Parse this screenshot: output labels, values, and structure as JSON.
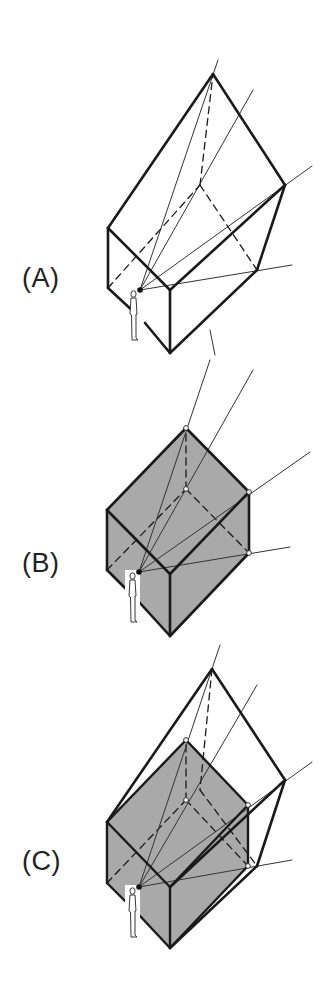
{
  "figure": {
    "panels": [
      {
        "id": "A",
        "label": "(A)",
        "label_pos": [
          22,
          265
        ],
        "shaded_box": false,
        "show_outer_volume": true
      },
      {
        "id": "B",
        "label": "(B)",
        "label_pos": [
          22,
          550
        ],
        "shaded_box": true,
        "show_outer_volume": false
      },
      {
        "id": "C",
        "label": "(C)",
        "label_pos": [
          22,
          848
        ],
        "shaded_box": true,
        "show_outer_volume": true
      }
    ],
    "colors": {
      "stroke": "#1a1a1a",
      "thin_stroke": "#333333",
      "shade": "#a9a9a9",
      "figure_fill": "#ffffff",
      "background": "#ffffff"
    },
    "geometry": {
      "A": {
        "eye": [
          140,
          290
        ],
        "outer_solid": [
          [
            108,
            228
          ],
          [
            213,
            74
          ],
          [
            285,
            185
          ],
          [
            257,
            270
          ],
          [
            170,
            353
          ],
          [
            108,
            288
          ]
        ],
        "outer_edges": [
          [
            [
              108,
              228
            ],
            [
              213,
              74
            ]
          ],
          [
            [
              213,
              74
            ],
            [
              285,
              185
            ]
          ],
          [
            [
              285,
              185
            ],
            [
              257,
              270
            ]
          ],
          [
            [
              257,
              270
            ],
            [
              170,
              353
            ]
          ],
          [
            [
              108,
              228
            ],
            [
              108,
              288
            ]
          ],
          [
            [
              108,
              228
            ],
            [
              170,
              290
            ]
          ],
          [
            [
              170,
              290
            ],
            [
              285,
              185
            ]
          ],
          [
            [
              170,
              290
            ],
            [
              170,
              353
            ]
          ],
          [
            [
              108,
              288
            ],
            [
              135,
              313
            ]
          ],
          [
            [
              145,
              323
            ],
            [
              170,
              353
            ]
          ]
        ],
        "hidden_edges": [
          [
            [
              108,
              288
            ],
            [
              200,
              185
            ]
          ],
          [
            [
              200,
              185
            ],
            [
              213,
              74
            ]
          ],
          [
            [
              200,
              185
            ],
            [
              257,
              270
            ]
          ]
        ],
        "rays": [
          [
            [
              140,
              290
            ],
            [
              218,
              60
            ]
          ],
          [
            [
              140,
              290
            ],
            [
              253,
              90
            ]
          ],
          [
            [
              140,
              290
            ],
            [
              312,
              166
            ]
          ],
          [
            [
              140,
              290
            ],
            [
              292,
              265
            ]
          ]
        ],
        "extra_ticks": [
          [
            [
              210,
              330
            ],
            [
              215,
              355
            ]
          ]
        ],
        "figure": [
          130,
          290
        ]
      },
      "B": {
        "eye": [
          139,
          572
        ],
        "shaded_solid": [
          [
            107,
            510
          ],
          [
            186,
            428
          ],
          [
            249,
            492
          ],
          [
            249,
            553
          ],
          [
            170,
            636
          ],
          [
            107,
            570
          ]
        ],
        "box_edges": [
          [
            [
              107,
              510
            ],
            [
              186,
              428
            ]
          ],
          [
            [
              186,
              428
            ],
            [
              249,
              492
            ]
          ],
          [
            [
              249,
              492
            ],
            [
              249,
              553
            ]
          ],
          [
            [
              249,
              553
            ],
            [
              170,
              636
            ]
          ],
          [
            [
              107,
              510
            ],
            [
              107,
              570
            ]
          ],
          [
            [
              107,
              510
            ],
            [
              170,
              574
            ]
          ],
          [
            [
              170,
              574
            ],
            [
              249,
              492
            ]
          ],
          [
            [
              170,
              574
            ],
            [
              170,
              636
            ]
          ],
          [
            [
              107,
              570
            ],
            [
              125,
              588
            ]
          ],
          [
            [
              140,
              603
            ],
            [
              170,
              636
            ]
          ]
        ],
        "hidden_edges": [
          [
            [
              107,
              570
            ],
            [
              186,
              489
            ]
          ],
          [
            [
              186,
              489
            ],
            [
              186,
              428
            ]
          ],
          [
            [
              186,
              489
            ],
            [
              249,
              553
            ]
          ]
        ],
        "rays": [
          [
            [
              139,
              572
            ],
            [
              210,
              360
            ]
          ],
          [
            [
              139,
              572
            ],
            [
              253,
              370
            ]
          ],
          [
            [
              139,
              572
            ],
            [
              310,
              452
            ]
          ],
          [
            [
              139,
              572
            ],
            [
              290,
              547
            ]
          ]
        ],
        "nodes": [
          [
            186,
            428
          ],
          [
            186,
            489
          ],
          [
            249,
            492
          ],
          [
            249,
            553
          ]
        ],
        "extra_ticks": [
          [
            [
              218,
              645
            ],
            [
              220,
              650
            ]
          ]
        ],
        "figure": [
          129,
          572
        ]
      },
      "C": {
        "eye": [
          139,
          887
        ],
        "shaded_solid": [
          [
            107,
            822
          ],
          [
            186,
            740
          ],
          [
            248,
            805
          ],
          [
            248,
            866
          ],
          [
            170,
            948
          ],
          [
            107,
            883
          ]
        ],
        "box_edges": [
          [
            [
              107,
              822
            ],
            [
              186,
              740
            ]
          ],
          [
            [
              186,
              740
            ],
            [
              248,
              805
            ]
          ],
          [
            [
              248,
              805
            ],
            [
              248,
              866
            ]
          ],
          [
            [
              248,
              866
            ],
            [
              170,
              948
            ]
          ],
          [
            [
              107,
              822
            ],
            [
              107,
              883
            ]
          ],
          [
            [
              107,
              822
            ],
            [
              170,
              887
            ]
          ],
          [
            [
              170,
              887
            ],
            [
              248,
              805
            ]
          ],
          [
            [
              170,
              887
            ],
            [
              170,
              948
            ]
          ],
          [
            [
              107,
              883
            ],
            [
              125,
              901
            ]
          ],
          [
            [
              140,
              916
            ],
            [
              170,
              948
            ]
          ]
        ],
        "hidden_edges": [
          [
            [
              107,
              883
            ],
            [
              186,
              800
            ]
          ],
          [
            [
              186,
              800
            ],
            [
              186,
              740
            ]
          ],
          [
            [
              186,
              800
            ],
            [
              248,
              866
            ]
          ]
        ],
        "outer_edges": [
          [
            [
              107,
              822
            ],
            [
              212,
              669
            ]
          ],
          [
            [
              212,
              669
            ],
            [
              285,
              780
            ]
          ],
          [
            [
              285,
              780
            ],
            [
              257,
              866
            ]
          ],
          [
            [
              257,
              866
            ],
            [
              170,
              948
            ]
          ],
          [
            [
              170,
              887
            ],
            [
              285,
              780
            ]
          ]
        ],
        "outer_hidden_edges": [
          [
            [
              212,
              669
            ],
            [
              200,
              790
            ]
          ],
          [
            [
              200,
              790
            ],
            [
              257,
              866
            ]
          ]
        ],
        "rays": [
          [
            [
              139,
              887
            ],
            [
              220,
              645
            ]
          ],
          [
            [
              139,
              887
            ],
            [
              257,
              685
            ]
          ],
          [
            [
              139,
              887
            ],
            [
              312,
              762
            ]
          ],
          [
            [
              139,
              887
            ],
            [
              292,
              860
            ]
          ]
        ],
        "nodes": [
          [
            186,
            740
          ],
          [
            186,
            800
          ],
          [
            248,
            805
          ],
          [
            248,
            866
          ]
        ],
        "figure": [
          129,
          887
        ]
      }
    }
  }
}
